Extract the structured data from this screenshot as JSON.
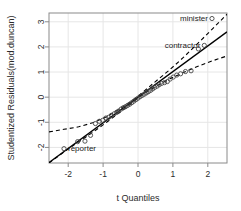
{
  "chart_data": {
    "type": "scatter",
    "title": "",
    "xlabel": "t Quantiles",
    "ylabel": "Studentized Residuals(mod.duncan)",
    "xlim": [
      -2.55,
      2.55
    ],
    "ylim": [
      -2.62,
      3.35
    ],
    "xticks": [
      -2,
      -1,
      0,
      1,
      2
    ],
    "xticklabels": [
      "-2",
      "-1",
      "0",
      "1",
      "2"
    ],
    "yticks": [
      -2,
      -1,
      0,
      1,
      2,
      3
    ],
    "yticklabels": [
      "-2",
      "-1",
      "0",
      "1",
      "2",
      "3"
    ],
    "grid": true,
    "legend": "none",
    "point_marker": "open-circle",
    "point_color": "#444444",
    "line_color": "#000000",
    "band_color": "#000000",
    "band_style": "dashed",
    "reference_line": {
      "intercept": 0.0,
      "slope": 1.02
    },
    "points": [
      {
        "x": -2.12,
        "y": -2.05
      },
      {
        "x": -1.73,
        "y": -1.77
      },
      {
        "x": -1.52,
        "y": -1.75
      },
      {
        "x": -1.36,
        "y": -1.52
      },
      {
        "x": -1.22,
        "y": -1.05
      },
      {
        "x": -1.11,
        "y": -0.96
      },
      {
        "x": -1.01,
        "y": -0.92
      },
      {
        "x": -0.92,
        "y": -0.83
      },
      {
        "x": -0.84,
        "y": -0.8
      },
      {
        "x": -0.76,
        "y": -0.72
      },
      {
        "x": -0.68,
        "y": -0.66
      },
      {
        "x": -0.61,
        "y": -0.6
      },
      {
        "x": -0.55,
        "y": -0.55
      },
      {
        "x": -0.48,
        "y": -0.47
      },
      {
        "x": -0.42,
        "y": -0.42
      },
      {
        "x": -0.36,
        "y": -0.38
      },
      {
        "x": -0.3,
        "y": -0.33
      },
      {
        "x": -0.24,
        "y": -0.28
      },
      {
        "x": -0.18,
        "y": -0.22
      },
      {
        "x": -0.12,
        "y": -0.16
      },
      {
        "x": -0.06,
        "y": -0.1
      },
      {
        "x": 0.0,
        "y": -0.04
      },
      {
        "x": 0.06,
        "y": 0.02
      },
      {
        "x": 0.12,
        "y": 0.07
      },
      {
        "x": 0.18,
        "y": 0.12
      },
      {
        "x": 0.24,
        "y": 0.17
      },
      {
        "x": 0.3,
        "y": 0.22
      },
      {
        "x": 0.36,
        "y": 0.27
      },
      {
        "x": 0.42,
        "y": 0.33
      },
      {
        "x": 0.48,
        "y": 0.39
      },
      {
        "x": 0.55,
        "y": 0.44
      },
      {
        "x": 0.61,
        "y": 0.5
      },
      {
        "x": 0.68,
        "y": 0.55
      },
      {
        "x": 0.76,
        "y": 0.58
      },
      {
        "x": 0.84,
        "y": 0.62
      },
      {
        "x": 0.92,
        "y": 0.72
      },
      {
        "x": 1.01,
        "y": 0.8
      },
      {
        "x": 1.11,
        "y": 0.88
      },
      {
        "x": 1.22,
        "y": 0.93
      },
      {
        "x": 1.36,
        "y": 1.02
      },
      {
        "x": 1.52,
        "y": 1.05
      },
      {
        "x": 1.73,
        "y": 1.92
      },
      {
        "x": 1.9,
        "y": 2.06
      },
      {
        "x": 2.12,
        "y": 3.13
      }
    ],
    "labeled_points": [
      {
        "name": "minister",
        "x": 2.12,
        "y": 3.13,
        "label": "minister",
        "label_side": "left"
      },
      {
        "name": "contractor",
        "x": 1.9,
        "y": 2.06,
        "label": "contractor",
        "label_side": "left"
      },
      {
        "name": "reporter",
        "x": -2.12,
        "y": -2.05,
        "label": "reporter",
        "label_side": "right"
      }
    ],
    "confidence_band_upper": [
      {
        "x": -2.55,
        "y": -1.38
      },
      {
        "x": -2.12,
        "y": -1.28
      },
      {
        "x": -1.7,
        "y": -1.18
      },
      {
        "x": -1.3,
        "y": -1.02
      },
      {
        "x": -0.9,
        "y": -0.78
      },
      {
        "x": -0.5,
        "y": -0.45
      },
      {
        "x": -0.2,
        "y": -0.18
      },
      {
        "x": 0.0,
        "y": 0.04
      },
      {
        "x": 0.2,
        "y": 0.27
      },
      {
        "x": 0.5,
        "y": 0.62
      },
      {
        "x": 0.9,
        "y": 1.08
      },
      {
        "x": 1.3,
        "y": 1.58
      },
      {
        "x": 1.7,
        "y": 2.12
      },
      {
        "x": 2.12,
        "y": 2.7
      },
      {
        "x": 2.55,
        "y": 3.3
      }
    ],
    "confidence_band_lower": [
      {
        "x": -2.55,
        "y": -2.62
      },
      {
        "x": -2.12,
        "y": -2.18
      },
      {
        "x": -1.7,
        "y": -1.78
      },
      {
        "x": -1.3,
        "y": -1.4
      },
      {
        "x": -0.9,
        "y": -1.0
      },
      {
        "x": -0.5,
        "y": -0.58
      },
      {
        "x": -0.2,
        "y": -0.26
      },
      {
        "x": 0.0,
        "y": -0.04
      },
      {
        "x": 0.2,
        "y": 0.16
      },
      {
        "x": 0.5,
        "y": 0.42
      },
      {
        "x": 0.9,
        "y": 0.72
      },
      {
        "x": 1.3,
        "y": 0.98
      },
      {
        "x": 1.7,
        "y": 1.22
      },
      {
        "x": 2.12,
        "y": 1.44
      },
      {
        "x": 2.55,
        "y": 1.64
      }
    ]
  },
  "figure": {
    "background": "#ffffff",
    "plot_border_color": "#8a8a8a",
    "grid_color": "#e6e6e6"
  }
}
